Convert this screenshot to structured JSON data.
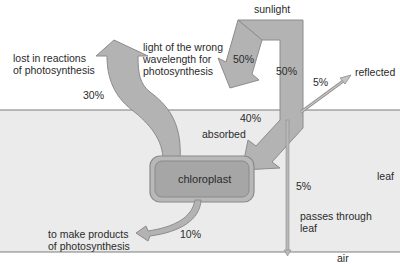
{
  "regions": {
    "leaf": "leaf",
    "air": "air"
  },
  "source": {
    "label": "sunlight"
  },
  "organelle": {
    "label": "chloroplast"
  },
  "flows": [
    {
      "id": "wrong-wavelength",
      "percent": "50%",
      "label_lines": [
        "light of the wrong",
        "wavelength for",
        "photosynthesis"
      ]
    },
    {
      "id": "incoming",
      "percent": "50%",
      "label_lines": []
    },
    {
      "id": "reflected",
      "percent": "5%",
      "label_lines": [
        "reflected"
      ]
    },
    {
      "id": "absorbed",
      "percent": "40%",
      "label_lines": [
        "absorbed"
      ]
    },
    {
      "id": "passes-through",
      "percent": "5%",
      "label_lines": [
        "passes through",
        "leaf"
      ]
    },
    {
      "id": "lost",
      "percent": "30%",
      "label_lines": [
        "lost in reactions",
        "of photosynthesis"
      ]
    },
    {
      "id": "products",
      "percent": "10%",
      "label_lines": [
        "to make products",
        "of photosynthesis"
      ]
    }
  ],
  "colors": {
    "arrow_fill": "#b3b3b3",
    "arrow_stroke": "#8c8c8c",
    "leaf_bg": "#ebebeb",
    "leaf_border": "#7a7a7a",
    "chloroplast_fill": "#a6a6a6"
  }
}
